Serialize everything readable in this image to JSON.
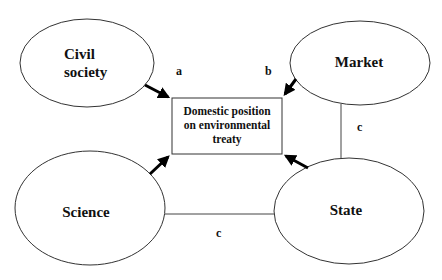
{
  "diagram": {
    "center_box": {
      "lines": [
        "Domestic position",
        "on environmental",
        "treaty"
      ]
    },
    "nodes": {
      "civil_society": {
        "lines": [
          "Civil",
          "society"
        ]
      },
      "market": {
        "lines": [
          "Market"
        ]
      },
      "science": {
        "lines": [
          "Science"
        ]
      },
      "state": {
        "lines": [
          "State"
        ]
      }
    },
    "edge_labels": {
      "a": "a",
      "b": "b",
      "c_market_state": "c",
      "c_science_state": "c"
    },
    "edges": [
      {
        "from": "civil_society",
        "to": "center_box",
        "type": "arrow",
        "label": "a"
      },
      {
        "from": "market",
        "to": "center_box",
        "type": "arrow",
        "label": "b"
      },
      {
        "from": "science",
        "to": "center_box",
        "type": "arrow"
      },
      {
        "from": "state",
        "to": "center_box",
        "type": "arrow"
      },
      {
        "from": "market",
        "to": "state",
        "type": "line",
        "label": "c"
      },
      {
        "from": "science",
        "to": "state",
        "type": "line",
        "label": "c"
      }
    ]
  }
}
